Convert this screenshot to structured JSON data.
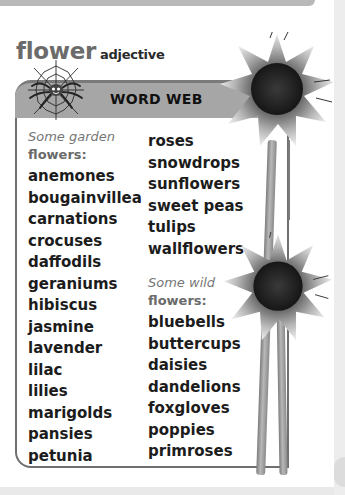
{
  "entry": {
    "headword": "flower",
    "part_of_speech": "adjective"
  },
  "word_web": {
    "title": "WORD WEB",
    "icon": "spider-web-icon",
    "garden": {
      "intro_italic": "Some garden",
      "intro_bold": "flowers:",
      "left_words": [
        "anemones",
        "bougainvillea",
        "carnations",
        "crocuses",
        "daffodils",
        "geraniums",
        "hibiscus",
        "jasmine",
        "lavender",
        "lilac",
        "lilies",
        "marigolds",
        "pansies",
        "petunia"
      ],
      "right_words": [
        "roses",
        "snowdrops",
        "sunflowers",
        "sweet peas",
        "tulips",
        "wallflowers"
      ]
    },
    "wild": {
      "intro_italic": "Some wild",
      "intro_bold": "flowers:",
      "words": [
        "bluebells",
        "buttercups",
        "daisies",
        "dandelions",
        "foxgloves",
        "poppies",
        "primroses"
      ]
    }
  },
  "illustration": "sunflowers-image",
  "colors": {
    "header_bar": "#a6a6a6",
    "border": "#6f6f6f",
    "headword": "#6b6b6b"
  }
}
